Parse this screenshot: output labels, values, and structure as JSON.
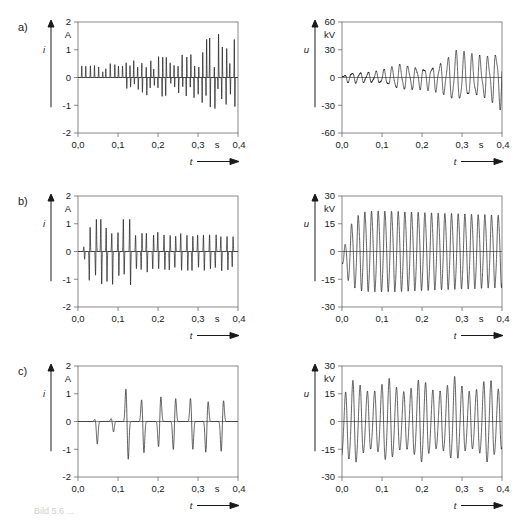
{
  "figure": {
    "background": "#ffffff",
    "trace_color": "#1a1a1a",
    "frame_color": "#6b6b6b",
    "caption_fragment": "Bild 5.6  ...",
    "row_labels": [
      {
        "id": "a",
        "label": "a)"
      },
      {
        "id": "b",
        "label": "b)"
      },
      {
        "id": "c",
        "label": "c)"
      }
    ]
  },
  "chart_data": [
    {
      "id": "a-left",
      "type": "line",
      "title": "",
      "xlabel": "t",
      "ylabel": "i",
      "x_unit": "s",
      "y_unit": "A",
      "xlim": [
        0.0,
        0.4
      ],
      "ylim": [
        -2,
        2
      ],
      "xticks": [
        0.0,
        0.1,
        0.2,
        0.3,
        0.4
      ],
      "xticklabels": [
        "0,0",
        "0,1",
        "0,2",
        "0,3",
        "0,4"
      ],
      "yticks": [
        -2,
        -1,
        0,
        1,
        2
      ],
      "yticklabels": [
        "-2",
        "-1",
        "0",
        "1",
        "2"
      ],
      "grid": false,
      "legend": "none",
      "waveform": {
        "kind": "impulse-train",
        "pulses_per_second": 100,
        "envelope": "growing",
        "envelope_start": 0.45,
        "envelope_end": 1.45,
        "positive_bias_early": true,
        "peak_max": 1.6,
        "peak_min": -1.15,
        "seed": 11
      }
    },
    {
      "id": "a-right",
      "type": "line",
      "title": "",
      "xlabel": "t",
      "ylabel": "u",
      "x_unit": "s",
      "y_unit": "kV",
      "xlim": [
        0.0,
        0.4
      ],
      "ylim": [
        -60,
        60
      ],
      "xticks": [
        0.0,
        0.1,
        0.2,
        0.3,
        0.4
      ],
      "xticklabels": [
        "0,0",
        "0,1",
        "0,2",
        "0,3",
        "0,4"
      ],
      "yticks": [
        -60,
        -30,
        0,
        30,
        60
      ],
      "yticklabels": [
        "-60",
        "-30",
        "0",
        "30",
        "60"
      ],
      "grid": false,
      "legend": "none",
      "waveform": {
        "kind": "modulated-sine",
        "carrier_hz": 50,
        "beat_hz": 7,
        "beat_depth": 0.42,
        "envelope": "growing",
        "envelope_start": 0.14,
        "envelope_end": 0.82,
        "peak_max": 50,
        "peak_min": -45,
        "seed": 23
      }
    },
    {
      "id": "b-left",
      "type": "line",
      "title": "",
      "xlabel": "t",
      "ylabel": "i",
      "x_unit": "s",
      "y_unit": "A",
      "xlim": [
        0.0,
        0.4
      ],
      "ylim": [
        -2,
        2
      ],
      "xticks": [
        0.0,
        0.1,
        0.2,
        0.3,
        0.4
      ],
      "xticklabels": [
        "0,0",
        "0,1",
        "0,2",
        "0,3",
        "0,4"
      ],
      "yticks": [
        -2,
        -1,
        0,
        1,
        2
      ],
      "yticklabels": [
        "-2",
        "-1",
        "0",
        "1",
        "2"
      ],
      "grid": false,
      "legend": "none",
      "waveform": {
        "kind": "impulse-train",
        "pulses_per_second": 70,
        "envelope": "decaying-transient",
        "transient_peak": 1.4,
        "steady_peak": 0.68,
        "peak_max": 1.18,
        "peak_min": -1.42,
        "seed": 37
      }
    },
    {
      "id": "b-right",
      "type": "line",
      "title": "",
      "xlabel": "t",
      "ylabel": "u",
      "x_unit": "s",
      "y_unit": "kV",
      "xlim": [
        0.0,
        0.4
      ],
      "ylim": [
        -30,
        30
      ],
      "xticks": [
        0.0,
        0.1,
        0.2,
        0.3,
        0.4
      ],
      "xticklabels": [
        "0,0",
        "0,1",
        "0,2",
        "0,3",
        "0,4"
      ],
      "yticks": [
        -30,
        -15,
        0,
        15,
        30
      ],
      "yticklabels": [
        "-30",
        "-15",
        "0",
        "15",
        "30"
      ],
      "grid": false,
      "legend": "none",
      "waveform": {
        "kind": "sine-steady",
        "carrier_hz": 60,
        "envelope": "slight-decay",
        "peak_max": 22,
        "peak_min": -21,
        "steady_peak": 19,
        "seed": 5
      }
    },
    {
      "id": "c-left",
      "type": "line",
      "title": "",
      "xlabel": "t",
      "ylabel": "i",
      "x_unit": "s",
      "y_unit": "A",
      "xlim": [
        0.0,
        0.4
      ],
      "ylim": [
        -2,
        2
      ],
      "xticks": [
        0.0,
        0.1,
        0.2,
        0.3,
        0.4
      ],
      "xticklabels": [
        "0,0",
        "0,1",
        "0,2",
        "0,3",
        "0,4"
      ],
      "yticks": [
        -2,
        -1,
        0,
        1,
        2
      ],
      "yticklabels": [
        "-2",
        "-1",
        "0",
        "1",
        "2"
      ],
      "grid": false,
      "legend": "none",
      "waveform": {
        "kind": "impulse-train",
        "pulses_per_second": 25,
        "envelope": "onset-at-0.11",
        "transient_peak": 1.28,
        "steady_peak": 0.9,
        "peak_max": 1.28,
        "peak_min": -1.5,
        "seed": 53
      }
    },
    {
      "id": "c-right",
      "type": "line",
      "title": "",
      "xlabel": "t",
      "ylabel": "u",
      "x_unit": "s",
      "y_unit": "kV",
      "xlim": [
        0.0,
        0.4
      ],
      "ylim": [
        -30,
        30
      ],
      "xticks": [
        0.0,
        0.1,
        0.2,
        0.3,
        0.4
      ],
      "xticklabels": [
        "0,0",
        "0,1",
        "0,2",
        "0,3",
        "0,4"
      ],
      "yticks": [
        -30,
        -15,
        0,
        15,
        30
      ],
      "yticklabels": [
        "-30",
        "-15",
        "0",
        "15",
        "30"
      ],
      "grid": false,
      "legend": "none",
      "waveform": {
        "kind": "beat-sine",
        "carrier_hz": 55,
        "beat_hz": 12,
        "beat_depth": 0.34,
        "peak_max": 23,
        "peak_min": -19,
        "seed": 71
      }
    }
  ]
}
